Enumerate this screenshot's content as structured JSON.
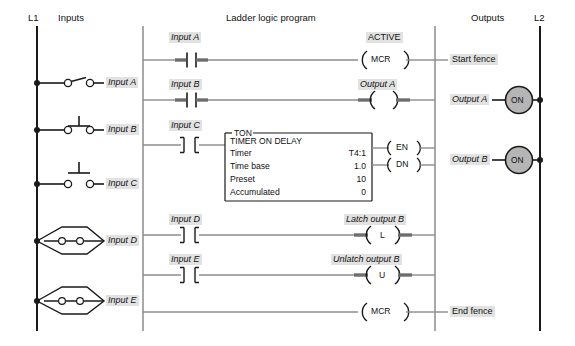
{
  "headers": {
    "l1": "L1",
    "inputs": "Inputs",
    "program": "Ladder logic program",
    "outputs": "Outputs",
    "l2": "L2"
  },
  "colors": {
    "rail": "#1a1a1a",
    "rung": "#8c8c8c",
    "energized": "#6e6e6e",
    "label_bg": "#e2e2e2",
    "lamp_fill": "#b5b5b5",
    "box_stroke": "#1a1a1a"
  },
  "field_devices": [
    {
      "label": "Input A",
      "type": "toggle-switch"
    },
    {
      "label": "Input B",
      "type": "pushbutton-nc"
    },
    {
      "label": "Input C",
      "type": "pushbutton-no"
    },
    {
      "label": "Input D",
      "type": "limit-switch"
    },
    {
      "label": "Input E",
      "type": "limit-switch"
    }
  ],
  "rungs": [
    {
      "contact_label": "Input A",
      "contact_type": "xic",
      "energized": true,
      "output_label": "MCR",
      "status": "ACTIVE",
      "output_type": "coil-mcr"
    },
    {
      "contact_label": "Input B",
      "contact_type": "xic",
      "energized": true,
      "output_label": "Output A",
      "coil_text": "",
      "output_type": "coil"
    },
    {
      "contact_label": "Input C",
      "contact_type": "xic",
      "energized": false,
      "output_type": "timer-block"
    },
    {
      "contact_label": "Input D",
      "contact_type": "xic",
      "energized": false,
      "output_label": "Latch output B",
      "coil_text": "L",
      "output_type": "coil-latch"
    },
    {
      "contact_label": "Input E",
      "contact_type": "xic",
      "energized": false,
      "output_label": "Unlatch output B",
      "coil_text": "U",
      "output_type": "coil-unlatch"
    },
    {
      "contact_label": "",
      "contact_type": "none",
      "energized": false,
      "output_label": "MCR",
      "output_type": "coil-mcr"
    }
  ],
  "timer": {
    "type": "TON",
    "title": "TIMER ON DELAY",
    "rows": [
      {
        "name": "Timer",
        "value": "T4:1"
      },
      {
        "name": "Time base",
        "value": "1.0"
      },
      {
        "name": "Preset",
        "value": "10"
      },
      {
        "name": "Accumulated",
        "value": "0"
      }
    ],
    "outputs": [
      {
        "label": "EN"
      },
      {
        "label": "DN"
      }
    ]
  },
  "output_devices": [
    {
      "label": "Start fence",
      "lamp": null
    },
    {
      "label": "Output A",
      "lamp": "ON"
    },
    {
      "label": "Output B",
      "lamp": "ON"
    },
    {
      "label": "End fence",
      "lamp": null
    }
  ]
}
